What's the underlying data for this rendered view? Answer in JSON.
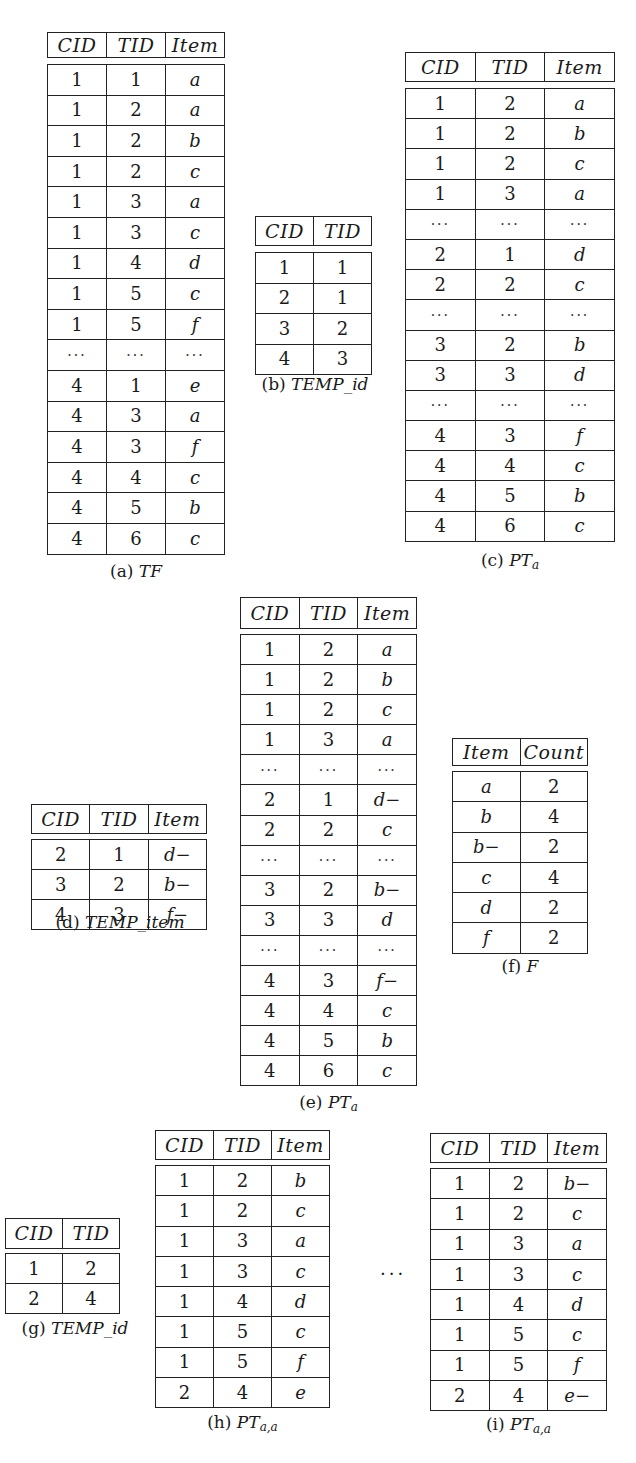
{
  "figure": {
    "tables": {
      "a": {
        "label": "(a)",
        "name": "TF",
        "sub": "",
        "columns": [
          "CID",
          "TID",
          "Item"
        ],
        "rows": [
          [
            "1",
            "1",
            "a"
          ],
          [
            "1",
            "2",
            "a"
          ],
          [
            "1",
            "2",
            "b"
          ],
          [
            "1",
            "2",
            "c"
          ],
          [
            "1",
            "3",
            "a"
          ],
          [
            "1",
            "3",
            "c"
          ],
          [
            "1",
            "4",
            "d"
          ],
          [
            "1",
            "5",
            "c"
          ],
          [
            "1",
            "5",
            "f"
          ],
          [
            "...",
            "...",
            "..."
          ],
          [
            "4",
            "1",
            "e"
          ],
          [
            "4",
            "3",
            "a"
          ],
          [
            "4",
            "3",
            "f"
          ],
          [
            "4",
            "4",
            "c"
          ],
          [
            "4",
            "5",
            "b"
          ],
          [
            "4",
            "6",
            "c"
          ]
        ]
      },
      "b": {
        "label": "(b)",
        "name": "TEMP_id",
        "sub": "",
        "columns": [
          "CID",
          "TID"
        ],
        "rows": [
          [
            "1",
            "1"
          ],
          [
            "2",
            "1"
          ],
          [
            "3",
            "2"
          ],
          [
            "4",
            "3"
          ]
        ]
      },
      "c": {
        "label": "(c)",
        "name": "PT",
        "sub": "a",
        "columns": [
          "CID",
          "TID",
          "Item"
        ],
        "rows": [
          [
            "1",
            "2",
            "a"
          ],
          [
            "1",
            "2",
            "b"
          ],
          [
            "1",
            "2",
            "c"
          ],
          [
            "1",
            "3",
            "a"
          ],
          [
            "...",
            "...",
            "..."
          ],
          [
            "2",
            "1",
            "d"
          ],
          [
            "2",
            "2",
            "c"
          ],
          [
            "...",
            "...",
            "..."
          ],
          [
            "3",
            "2",
            "b"
          ],
          [
            "3",
            "3",
            "d"
          ],
          [
            "...",
            "...",
            "..."
          ],
          [
            "4",
            "3",
            "f"
          ],
          [
            "4",
            "4",
            "c"
          ],
          [
            "4",
            "5",
            "b"
          ],
          [
            "4",
            "6",
            "c"
          ]
        ]
      },
      "d": {
        "label": "(d)",
        "name": "TEMP_item",
        "sub": "",
        "columns": [
          "CID",
          "TID",
          "Item"
        ],
        "rows": [
          [
            "2",
            "1",
            "d−"
          ],
          [
            "3",
            "2",
            "b−"
          ],
          [
            "4",
            "3",
            "f−"
          ]
        ]
      },
      "e": {
        "label": "(e)",
        "name": "PT",
        "sub": "a",
        "columns": [
          "CID",
          "TID",
          "Item"
        ],
        "rows": [
          [
            "1",
            "2",
            "a"
          ],
          [
            "1",
            "2",
            "b"
          ],
          [
            "1",
            "2",
            "c"
          ],
          [
            "1",
            "3",
            "a"
          ],
          [
            "...",
            "...",
            "..."
          ],
          [
            "2",
            "1",
            "d−"
          ],
          [
            "2",
            "2",
            "c"
          ],
          [
            "...",
            "...",
            "..."
          ],
          [
            "3",
            "2",
            "b−"
          ],
          [
            "3",
            "3",
            "d"
          ],
          [
            "...",
            "...",
            "..."
          ],
          [
            "4",
            "3",
            "f−"
          ],
          [
            "4",
            "4",
            "c"
          ],
          [
            "4",
            "5",
            "b"
          ],
          [
            "4",
            "6",
            "c"
          ]
        ]
      },
      "f": {
        "label": "(f)",
        "name": "F",
        "sub": "",
        "columns": [
          "Item",
          "Count"
        ],
        "rows": [
          [
            "a",
            "2"
          ],
          [
            "b",
            "4"
          ],
          [
            "b−",
            "2"
          ],
          [
            "c",
            "4"
          ],
          [
            "d",
            "2"
          ],
          [
            "f",
            "2"
          ]
        ]
      },
      "g": {
        "label": "(g)",
        "name": "TEMP_id",
        "sub": "",
        "columns": [
          "CID",
          "TID"
        ],
        "rows": [
          [
            "1",
            "2"
          ],
          [
            "2",
            "4"
          ]
        ]
      },
      "h": {
        "label": "(h)",
        "name": "PT",
        "sub": "a,a",
        "columns": [
          "CID",
          "TID",
          "Item"
        ],
        "rows": [
          [
            "1",
            "2",
            "b"
          ],
          [
            "1",
            "2",
            "c"
          ],
          [
            "1",
            "3",
            "a"
          ],
          [
            "1",
            "3",
            "c"
          ],
          [
            "1",
            "4",
            "d"
          ],
          [
            "1",
            "5",
            "c"
          ],
          [
            "1",
            "5",
            "f"
          ],
          [
            "2",
            "4",
            "e"
          ]
        ]
      },
      "i": {
        "label": "(i)",
        "name": "PT",
        "sub": "a,a",
        "columns": [
          "CID",
          "TID",
          "Item"
        ],
        "rows": [
          [
            "1",
            "2",
            "b−"
          ],
          [
            "1",
            "2",
            "c"
          ],
          [
            "1",
            "3",
            "a"
          ],
          [
            "1",
            "3",
            "c"
          ],
          [
            "1",
            "4",
            "d"
          ],
          [
            "1",
            "5",
            "c"
          ],
          [
            "1",
            "5",
            "f"
          ],
          [
            "2",
            "4",
            "e−"
          ]
        ]
      }
    },
    "between_h_i": "...",
    "footer_fragment": ""
  }
}
